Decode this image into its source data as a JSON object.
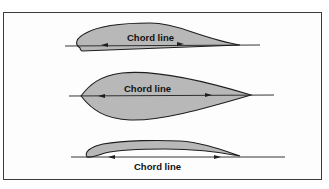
{
  "diagram": {
    "title": "",
    "airfoils": [
      {
        "id": "cambered-airfoil",
        "label": "Chord line",
        "label_position": "inside"
      },
      {
        "id": "symmetrical-airfoil",
        "label": "Chord line",
        "label_position": "inside"
      },
      {
        "id": "undercambered-airfoil",
        "label": "Chord line",
        "label_position": "below"
      }
    ],
    "colors": {
      "fill": "#b8b8b8",
      "stroke": "#1e1e1e",
      "border": "#3a3a3a"
    }
  }
}
